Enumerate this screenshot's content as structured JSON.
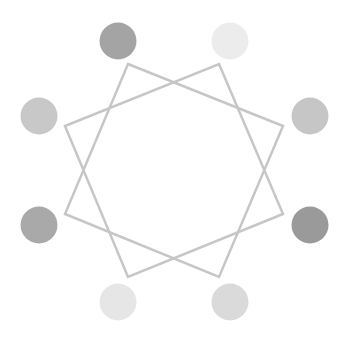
{
  "canvas": {
    "width": 351,
    "height": 344,
    "background": "#ffffff"
  },
  "star": {
    "stroke": "#c6c6c6",
    "stroke_width": 2.5,
    "squares": [
      {
        "name": "square-a",
        "points": [
          [
            128,
            64
          ],
          [
            283,
            126
          ],
          [
            219,
            277
          ],
          [
            65,
            214
          ]
        ]
      },
      {
        "name": "square-b",
        "points": [
          [
            219,
            64
          ],
          [
            283,
            214
          ],
          [
            128,
            277
          ],
          [
            65,
            126
          ]
        ]
      }
    ]
  },
  "circles": [
    {
      "name": "circle-top-left",
      "cx": 118,
      "cy": 41,
      "r": 18.5,
      "fill": "#a4a4a4"
    },
    {
      "name": "circle-top-right",
      "cx": 230,
      "cy": 41,
      "r": 18.5,
      "fill": "#ececec"
    },
    {
      "name": "circle-left-upper",
      "cx": 39,
      "cy": 116,
      "r": 18.5,
      "fill": "#c8c8c8"
    },
    {
      "name": "circle-right-upper",
      "cx": 310,
      "cy": 116,
      "r": 18.5,
      "fill": "#c6c6c6"
    },
    {
      "name": "circle-left-lower",
      "cx": 39,
      "cy": 225,
      "r": 18.5,
      "fill": "#a9a9a9"
    },
    {
      "name": "circle-right-lower",
      "cx": 310,
      "cy": 225,
      "r": 18.5,
      "fill": "#9a9a9a"
    },
    {
      "name": "circle-bottom-left",
      "cx": 118,
      "cy": 302,
      "r": 18.5,
      "fill": "#e6e6e6"
    },
    {
      "name": "circle-bottom-right",
      "cx": 230,
      "cy": 302,
      "r": 18.5,
      "fill": "#dadada"
    }
  ]
}
